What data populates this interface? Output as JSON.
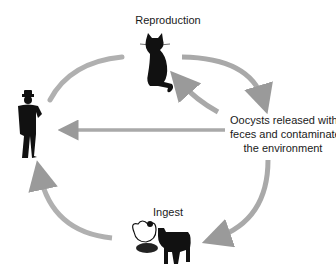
{
  "labels": {
    "reproduction": "Reproduction",
    "oocysts_line1": "Oocysts released with",
    "oocysts_line2": "feces and contaminate",
    "oocysts_line3": "the environment",
    "ingest": "Ingest"
  },
  "nodes": [
    {
      "id": "cat",
      "icon": "cat-icon",
      "label": "Reproduction"
    },
    {
      "id": "environment",
      "label": "Oocysts released with feces and contaminate the environment"
    },
    {
      "id": "livestock",
      "icon": [
        "chicken-icon",
        "cow-icon"
      ],
      "label": "Ingest"
    },
    {
      "id": "human",
      "icon": "human-icon"
    }
  ],
  "edges": [
    {
      "from": "human",
      "to": "cat",
      "style": "arc"
    },
    {
      "from": "cat",
      "to": "environment",
      "style": "arc-arrow"
    },
    {
      "from": "environment",
      "to": "cat",
      "style": "arc-arrow"
    },
    {
      "from": "environment",
      "to": "human",
      "style": "straight-arrow"
    },
    {
      "from": "environment",
      "to": "livestock",
      "style": "arc-arrow"
    },
    {
      "from": "livestock",
      "to": "human",
      "style": "arc-arrow"
    }
  ],
  "colors": {
    "arrow": "#a9a9a9",
    "arrow_dark": "#8f8f8f",
    "silhouette": "#111111",
    "text": "#1a1a1a",
    "background": "#ffffff"
  }
}
